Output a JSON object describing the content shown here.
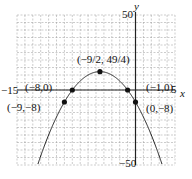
{
  "chart_data": {
    "type": "line",
    "title": "",
    "function": "y = -x^2 - 9x - 8",
    "xlabel": "x",
    "ylabel": "y",
    "xlim": [
      -15,
      5
    ],
    "ylim": [
      -50,
      50
    ],
    "grid": true,
    "grid_step_x": 1,
    "grid_step_y": 5,
    "tick_labels": {
      "x_min": "−15",
      "x_max": "5",
      "y_max": "50",
      "y_min": "−50"
    },
    "points": [
      {
        "x": -4.5,
        "y": 12.25,
        "label": "(−9/2, 49/4)"
      },
      {
        "x": -8,
        "y": 0,
        "label": "(−8,0)"
      },
      {
        "x": -1,
        "y": 0,
        "label": "(−1,0)"
      },
      {
        "x": -9,
        "y": -8,
        "label": "(−9,−8)"
      },
      {
        "x": 0,
        "y": -8,
        "label": "(0,−8)"
      }
    ]
  }
}
